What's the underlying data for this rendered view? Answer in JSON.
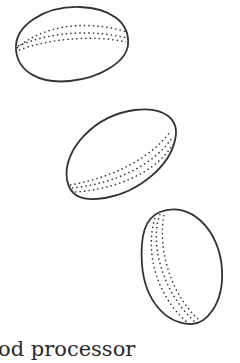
{
  "illustration": {
    "description": "Three oval seed/bean shapes drawn in line art with dotted shading",
    "stroke_color": "#333333",
    "items": [
      {
        "name": "seed-top"
      },
      {
        "name": "seed-middle"
      },
      {
        "name": "seed-bottom"
      }
    ]
  },
  "caption": {
    "text": "od processor"
  }
}
